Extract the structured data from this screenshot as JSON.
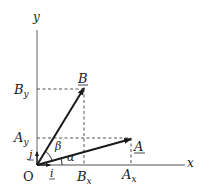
{
  "diagram": {
    "type": "vector-components",
    "axes": {
      "x_label": "x",
      "y_label": "y",
      "origin_label": "O"
    },
    "unit_vectors": {
      "i_label": "i",
      "j_label": "j"
    },
    "vectors": [
      {
        "name": "A",
        "label": "A",
        "x_component_label": "A",
        "x_component_sub": "x",
        "y_component_label": "A",
        "y_component_sub": "y",
        "angle_label": "α"
      },
      {
        "name": "B",
        "label": "B",
        "x_component_label": "B",
        "x_component_sub": "x",
        "y_component_label": "B",
        "y_component_sub": "y",
        "angle_label": "β"
      }
    ],
    "colors": {
      "axis": "#8a8a8a",
      "vector": "#1a1a1a",
      "dashed": "#555555"
    }
  }
}
